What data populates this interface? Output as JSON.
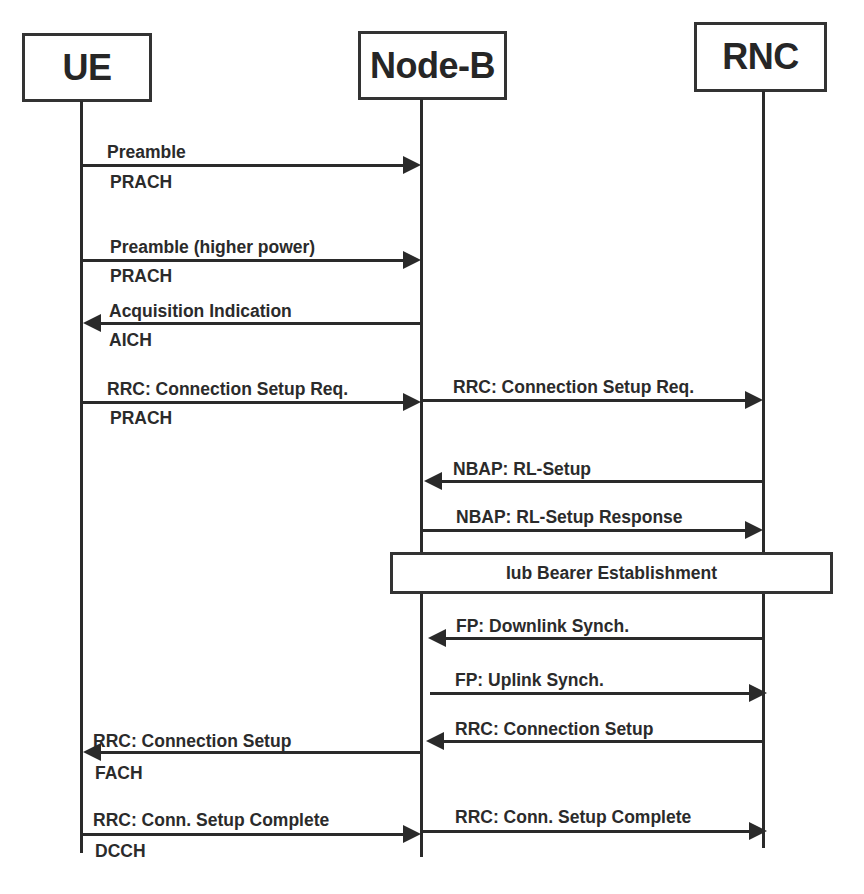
{
  "diagram": {
    "type": "sequence",
    "entities": [
      {
        "id": "ue",
        "label": "UE"
      },
      {
        "id": "nodeb",
        "label": "Node-B"
      },
      {
        "id": "rnc",
        "label": "RNC"
      }
    ],
    "messages": [
      {
        "from": "ue",
        "to": "nodeb",
        "label": "Preamble",
        "channel": "PRACH"
      },
      {
        "from": "ue",
        "to": "nodeb",
        "label": "Preamble (higher power)",
        "channel": "PRACH"
      },
      {
        "from": "nodeb",
        "to": "ue",
        "label": "Acquisition Indication",
        "channel": "AICH"
      },
      {
        "from": "ue",
        "to": "nodeb",
        "label": "RRC: Connection Setup Req.",
        "channel": "PRACH"
      },
      {
        "from": "nodeb",
        "to": "rnc",
        "label": "RRC: Connection Setup Req."
      },
      {
        "from": "rnc",
        "to": "nodeb",
        "label": "NBAP: RL-Setup"
      },
      {
        "from": "nodeb",
        "to": "rnc",
        "label": "NBAP: RL-Setup Response"
      },
      {
        "from": "rnc",
        "to": "nodeb",
        "label": "FP: Downlink Synch."
      },
      {
        "from": "nodeb",
        "to": "rnc",
        "label": "FP: Uplink Synch."
      },
      {
        "from": "rnc",
        "to": "nodeb",
        "label": "RRC: Connection Setup"
      },
      {
        "from": "nodeb",
        "to": "ue",
        "label": "RRC: Connection Setup",
        "channel": "FACH"
      },
      {
        "from": "ue",
        "to": "nodeb",
        "label": "RRC: Conn. Setup Complete",
        "channel": "DCCH"
      },
      {
        "from": "nodeb",
        "to": "rnc",
        "label": "RRC: Conn. Setup Complete"
      }
    ],
    "phase": {
      "label": "Iub Bearer Establishment",
      "span": [
        "nodeb",
        "rnc"
      ]
    }
  }
}
